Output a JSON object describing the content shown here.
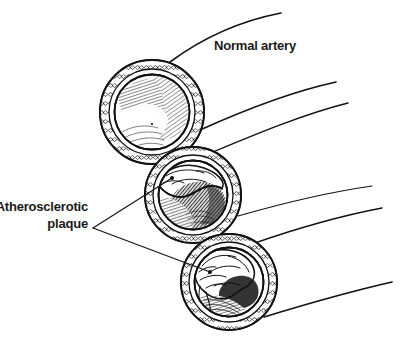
{
  "figure": {
    "background_color": "#ffffff",
    "ink_color": "#111111",
    "text_color": "#1a1a1a",
    "width": 412,
    "height": 357
  },
  "labels": {
    "normal_artery": "Normal artery",
    "plaque_line1": "Atherosclerotic",
    "plaque_line2": "plaque"
  },
  "diagram_data": {
    "type": "anatomical-line-illustration",
    "subject": "artery cross-sections showing atherosclerotic narrowing",
    "style": "black-and-white pen-and-ink hatching",
    "vessels": [
      {
        "id": "vessel-normal",
        "name": "Normal artery",
        "stage": "normal",
        "center_x": 152,
        "center_y": 112,
        "outer_radius": 52,
        "wall_radius": 44,
        "lumen_radius": 37,
        "plaque_present": false,
        "lumen_open_percent": 100,
        "description": "Fully patent lumen with smooth inner wall and radial hatching"
      },
      {
        "id": "vessel-moderate",
        "name": "Artery with moderate plaque",
        "stage": "moderate-stenosis",
        "center_x": 193,
        "center_y": 195,
        "outer_radius": 48,
        "wall_radius": 41,
        "lumen_radius": 34,
        "plaque_present": true,
        "lumen_open_percent": 55,
        "description": "Plaque bulging from upper wall partially narrowing the lumen"
      },
      {
        "id": "vessel-severe",
        "name": "Artery with severe plaque",
        "stage": "severe-stenosis",
        "center_x": 229,
        "center_y": 282,
        "outer_radius": 48,
        "wall_radius": 41,
        "lumen_radius": 34,
        "plaque_present": true,
        "lumen_open_percent": 20,
        "description": "Large lobulated plaque filling most of the lumen leaving a crescent channel"
      }
    ],
    "wall_layers": [
      "adventitia (outer, stippled chain texture)",
      "media (smooth muscle ring)",
      "intima / lumen lining (fine radial hatching)"
    ],
    "leader_lines": [
      {
        "from": "plaque-label",
        "to_vessel": "vessel-moderate",
        "endpoint_x": 172,
        "endpoint_y": 178
      },
      {
        "from": "plaque-label",
        "to_vessel": "vessel-severe",
        "endpoint_x": 210,
        "endpoint_y": 272
      }
    ],
    "leader_vertex": {
      "x": 93,
      "y": 228
    }
  }
}
